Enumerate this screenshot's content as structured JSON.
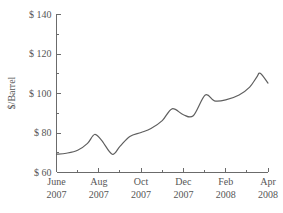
{
  "chart_data": {
    "type": "line",
    "title": "",
    "subtitle": "",
    "xlabel": "",
    "ylabel": "$/Barrel",
    "ylim": [
      60,
      140
    ],
    "xlim": [
      "June 2007",
      "Apr 2008"
    ],
    "grid": false,
    "legend_position": "none",
    "y_major_ticks": [
      60,
      80,
      100,
      120,
      140
    ],
    "y_minor_ticks": [
      70,
      90,
      110,
      130
    ],
    "y_tick_labels": [
      "$ 60",
      "$ 80",
      "$ 100",
      "$ 120",
      "$ 140"
    ],
    "x_major_ticks": [
      "June",
      "Aug",
      "Oct",
      "Dec",
      "Feb",
      "Apr"
    ],
    "x_major_tick_years": [
      "2007",
      "2007",
      "2007",
      "2007",
      "2008",
      "2008"
    ],
    "x_all_tick_months": [
      "June",
      "July",
      "Aug",
      "Sep",
      "Oct",
      "Nov",
      "Dec",
      "Jan",
      "Feb",
      "Mar",
      "Apr"
    ],
    "series": [
      {
        "name": "Crude Oil Price",
        "color": "#5f5f5f",
        "x": [
          "2007-06-01",
          "2007-06-15",
          "2007-07-01",
          "2007-07-15",
          "2007-07-25",
          "2007-08-05",
          "2007-08-20",
          "2007-09-01",
          "2007-09-15",
          "2007-10-01",
          "2007-10-15",
          "2007-11-01",
          "2007-11-15",
          "2007-12-01",
          "2007-12-15",
          "2008-01-02",
          "2008-01-15",
          "2008-02-01",
          "2008-02-20",
          "2008-03-05",
          "2008-03-15",
          "2008-03-20",
          "2008-04-01"
        ],
        "values": [
          69,
          69.5,
          71,
          74.5,
          79,
          76,
          69,
          73,
          78,
          80,
          82,
          86,
          92,
          89,
          88.5,
          99,
          96,
          96.5,
          99,
          103,
          108,
          110,
          105
        ]
      }
    ]
  },
  "axis": {
    "y_title": "$/Barrel"
  }
}
